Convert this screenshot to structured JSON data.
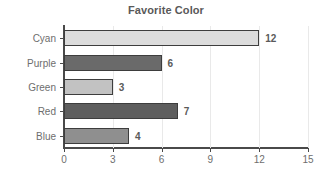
{
  "chart_data": {
    "type": "bar",
    "orientation": "horizontal",
    "title": "Favorite Color",
    "xlabel": "",
    "ylabel": "",
    "categories": [
      "Cyan",
      "Purple",
      "Green",
      "Red",
      "Blue"
    ],
    "values": [
      12,
      6,
      3,
      7,
      4
    ],
    "value_labels": [
      "12",
      "6",
      "3",
      "7",
      "4"
    ],
    "bar_colors": [
      "#dcdcdc",
      "#6a6a6a",
      "#c2c2c2",
      "#5e5e5e",
      "#8f8f8f"
    ],
    "bar_edge_color": "#3d3d3d",
    "xlim": [
      0,
      15
    ],
    "xticks": [
      0,
      3,
      6,
      9,
      12,
      15
    ],
    "xtick_labels": [
      "0",
      "3",
      "6",
      "9",
      "12",
      "15"
    ],
    "grid": true,
    "grid_color": "#e9e9e9",
    "legend": "none",
    "axis_color": "#4a4a4a",
    "text_color": "#6e6e6e",
    "title_color": "#595959"
  }
}
